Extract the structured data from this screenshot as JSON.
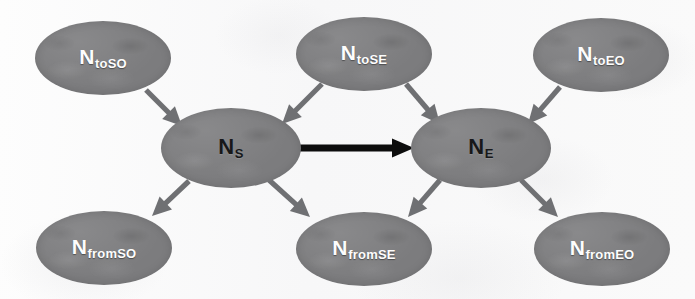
{
  "diagram": {
    "background_color": "#fbfbfb",
    "node_fill_color": "#7c7c7e",
    "edge_color": "#6f7073",
    "highlight_edge_color": "#0d0d0d",
    "nodes": [
      {
        "id": "toSO",
        "base": "N",
        "sub": "toSO",
        "label": "NtoSO",
        "role": "source-predecessor",
        "label_style": "light",
        "cx": 103,
        "cy": 58,
        "rx": 68,
        "ry": 37
      },
      {
        "id": "toSE",
        "base": "N",
        "sub": "toSE",
        "label": "NtoSE",
        "role": "shared-predecessor",
        "label_style": "light",
        "cx": 364,
        "cy": 54,
        "rx": 68,
        "ry": 37
      },
      {
        "id": "toEO",
        "base": "N",
        "sub": "toEO",
        "label": "NtoEO",
        "role": "end-predecessor",
        "label_style": "light",
        "cx": 601,
        "cy": 55,
        "rx": 68,
        "ry": 37
      },
      {
        "id": "S",
        "base": "N",
        "sub": "S",
        "label": "NS",
        "role": "start-node",
        "label_style": "dark",
        "cx": 231,
        "cy": 148,
        "rx": 70,
        "ry": 40
      },
      {
        "id": "E",
        "base": "N",
        "sub": "E",
        "label": "NE",
        "role": "end-node",
        "label_style": "dark",
        "cx": 481,
        "cy": 148,
        "rx": 70,
        "ry": 40
      },
      {
        "id": "fromSO",
        "base": "N",
        "sub": "fromSO",
        "label": "NfromSO",
        "role": "source-successor",
        "label_style": "light",
        "cx": 104,
        "cy": 248,
        "rx": 68,
        "ry": 37
      },
      {
        "id": "fromSE",
        "base": "N",
        "sub": "fromSE",
        "label": "NfromSE",
        "role": "shared-successor",
        "label_style": "light",
        "cx": 364,
        "cy": 249,
        "rx": 68,
        "ry": 37
      },
      {
        "id": "fromEO",
        "base": "N",
        "sub": "fromEO",
        "label": "NfromEO",
        "role": "end-successor",
        "label_style": "light",
        "cx": 602,
        "cy": 249,
        "rx": 68,
        "ry": 37
      }
    ],
    "edges": [
      {
        "id": "toSO-to-S",
        "from": "toSO",
        "to": "S",
        "style": "normal",
        "x1": 146,
        "y1": 90,
        "x2": 182,
        "y2": 126
      },
      {
        "id": "toSE-to-S",
        "from": "toSE",
        "to": "S",
        "style": "normal",
        "x1": 322,
        "y1": 84,
        "x2": 282,
        "y2": 124
      },
      {
        "id": "toSE-to-E",
        "from": "toSE",
        "to": "E",
        "style": "normal",
        "x1": 406,
        "y1": 84,
        "x2": 440,
        "y2": 124
      },
      {
        "id": "toEO-to-E",
        "from": "toEO",
        "to": "E",
        "style": "normal",
        "x1": 560,
        "y1": 87,
        "x2": 528,
        "y2": 124
      },
      {
        "id": "S-to-E",
        "from": "S",
        "to": "E",
        "style": "highlight",
        "x1": 300,
        "y1": 148,
        "x2": 414,
        "y2": 148
      },
      {
        "id": "S-to-fromSO",
        "from": "S",
        "to": "fromSO",
        "style": "normal",
        "x1": 189,
        "y1": 181,
        "x2": 152,
        "y2": 216
      },
      {
        "id": "S-to-fromSE",
        "from": "S",
        "to": "fromSE",
        "style": "normal",
        "x1": 269,
        "y1": 180,
        "x2": 310,
        "y2": 217
      },
      {
        "id": "E-to-fromSE",
        "from": "E",
        "to": "fromSE",
        "style": "normal",
        "x1": 440,
        "y1": 180,
        "x2": 408,
        "y2": 217
      },
      {
        "id": "E-to-fromEO",
        "from": "E",
        "to": "fromEO",
        "style": "normal",
        "x1": 521,
        "y1": 180,
        "x2": 558,
        "y2": 217
      }
    ]
  }
}
